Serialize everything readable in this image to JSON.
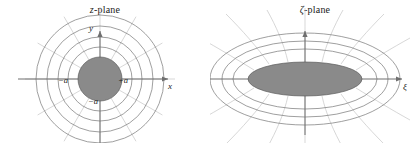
{
  "figure": {
    "background_color": "#ffffff",
    "shade_color": "#8a8a8a",
    "contour_color": "#757575",
    "flowline_color": "#c6c6c6",
    "axis_color": "#6f6f6f"
  },
  "panels": [
    {
      "id": "z-plane",
      "title_symbol": "z",
      "title_suffix": "-plane",
      "axes": {
        "horizontal_label": "x",
        "vertical_label": "y"
      },
      "point_labels": [
        {
          "text": "−a",
          "name": "label-minus-a-left"
        },
        {
          "text": "+a",
          "name": "label-plus-a-right"
        },
        {
          "text": "−a",
          "name": "label-minus-a-bottom"
        }
      ],
      "geometry": {
        "center": [
          100,
          79
        ],
        "shaded_radius": 22,
        "contour_radii": [
          32,
          42,
          53,
          64
        ],
        "radial_line_count": 12
      }
    },
    {
      "id": "zeta-plane",
      "title_symbol": "ζ",
      "title_suffix": "-plane",
      "axes": {
        "horizontal_label": "ξ",
        "vertical_label": ""
      },
      "point_labels": [],
      "geometry": {
        "center": [
          95,
          79
        ],
        "shaded_rx": 57,
        "shaded_ry": 17,
        "contour_rx": [
          72,
          83,
          95
        ],
        "contour_ry": [
          30,
          38,
          46
        ],
        "hyperbola_count": 10
      }
    }
  ]
}
